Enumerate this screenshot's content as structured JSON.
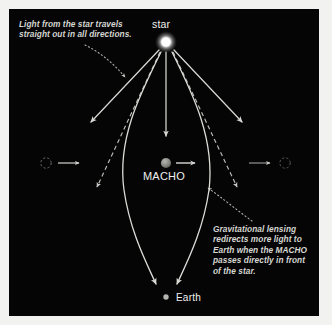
{
  "figure": {
    "background_color": "#f2f2f0",
    "panel_color": "#050505",
    "text_color": "#d6d6d2",
    "ray_color": "#d8d8d4",
    "star_color": "#ffffff",
    "macho_color": "#8a8a8a",
    "earth_color": "#b8b8b4"
  },
  "labels": {
    "star": "star",
    "macho": "MACHO",
    "earth": "Earth"
  },
  "annotations": {
    "light": "Light from the star travels\nstraight out in all directions.",
    "lensing": "Gravitational lensing\nredirects more light to\nEarth when the MACHO\npasses directly in front\nof the star."
  },
  "diagram_data": {
    "type": "schematic",
    "objects": [
      {
        "name": "star",
        "x": 166,
        "y": 42,
        "radius": 6,
        "style": "glowing-white-disc"
      },
      {
        "name": "macho",
        "x": 166,
        "y": 163,
        "radius": 5,
        "style": "gray-sphere"
      },
      {
        "name": "earth",
        "x": 166,
        "y": 297,
        "radius": 2.6,
        "style": "small-gray-dot"
      },
      {
        "name": "macho-ghost-left",
        "x": 46,
        "y": 163,
        "radius": 5,
        "style": "dashed-outline-circle"
      },
      {
        "name": "macho-ghost-right",
        "x": 286,
        "y": 163,
        "radius": 5,
        "style": "dashed-outline-circle"
      }
    ],
    "motion_arrows": [
      {
        "name": "macho-motion-center",
        "from_x": 176,
        "to_x": 196,
        "y": 163,
        "direction": "right"
      },
      {
        "name": "macho-motion-left",
        "from_x": 58,
        "to_x": 80,
        "y": 163,
        "direction": "right"
      },
      {
        "name": "macho-motion-right",
        "from_x": 248,
        "to_x": 272,
        "y": 163,
        "direction": "right"
      }
    ],
    "straight_rays": [
      {
        "name": "ray-far-left",
        "from": [
          160,
          50
        ],
        "to": [
          90,
          124
        ]
      },
      {
        "name": "ray-center",
        "from": [
          166,
          52
        ],
        "to": [
          166,
          138
        ]
      },
      {
        "name": "ray-far-right",
        "from": [
          173,
          50
        ],
        "to": [
          243,
          124
        ]
      }
    ],
    "undeflected_dashed_rays": [
      {
        "name": "dashed-ray-left",
        "from": [
          160,
          52
        ],
        "to": [
          96,
          190
        ]
      },
      {
        "name": "dashed-ray-right",
        "from": [
          173,
          52
        ],
        "to": [
          238,
          190
        ]
      }
    ],
    "lensed_curved_rays": [
      {
        "name": "lensed-ray-left",
        "from": [
          161,
          52
        ],
        "to": [
          157,
          288
        ],
        "bows": "outward-left",
        "apex_x": 117
      },
      {
        "name": "lensed-ray-right",
        "from": [
          172,
          52
        ],
        "to": [
          176,
          288
        ],
        "bows": "outward-right",
        "apex_x": 216
      }
    ],
    "leader_lines": [
      {
        "name": "leader-light-annotation",
        "from": [
          86,
          46
        ],
        "to": [
          128,
          80
        ],
        "style": "dotted-curve"
      },
      {
        "name": "leader-lensing-annotation",
        "from": [
          250,
          222
        ],
        "to": [
          205,
          187
        ],
        "style": "dotted-curve"
      }
    ]
  }
}
